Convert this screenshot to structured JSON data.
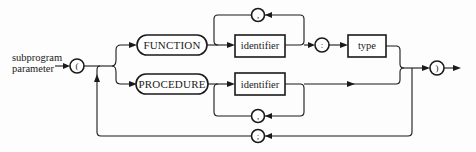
{
  "diagram": {
    "type": "syntax-diagram",
    "title_label": [
      "subprogram",
      "parameter"
    ],
    "nodes": {
      "open_paren": {
        "kind": "terminal-circle",
        "symbol": "("
      },
      "function_kw": {
        "kind": "keyword",
        "label": "FUNCTION"
      },
      "procedure_kw": {
        "kind": "keyword",
        "label": "PROCEDURE"
      },
      "identifier_top": {
        "kind": "nonterminal",
        "label": "identifier"
      },
      "identifier_bottom": {
        "kind": "nonterminal",
        "label": "identifier"
      },
      "comma_top": {
        "kind": "terminal-circle",
        "symbol": ","
      },
      "comma_bottom": {
        "kind": "terminal-circle",
        "symbol": ","
      },
      "colon": {
        "kind": "terminal-circle",
        "symbol": ":"
      },
      "type_box": {
        "kind": "nonterminal",
        "label": "type"
      },
      "semicolon_loop": {
        "kind": "terminal-circle",
        "symbol": ";"
      },
      "close_paren": {
        "kind": "terminal-circle",
        "symbol": ")"
      }
    },
    "edges": [
      [
        "entry",
        "open_paren"
      ],
      [
        "open_paren",
        "function_kw"
      ],
      [
        "open_paren",
        "procedure_kw"
      ],
      [
        "function_kw",
        "identifier_top"
      ],
      [
        "identifier_top",
        "comma_top"
      ],
      [
        "comma_top",
        "identifier_top"
      ],
      [
        "identifier_top",
        "colon"
      ],
      [
        "colon",
        "type_box"
      ],
      [
        "type_box",
        "close_paren"
      ],
      [
        "procedure_kw",
        "identifier_bottom"
      ],
      [
        "identifier_bottom",
        "comma_bottom"
      ],
      [
        "comma_bottom",
        "identifier_bottom"
      ],
      [
        "identifier_bottom",
        "close_paren"
      ],
      [
        "join",
        "semicolon_loop"
      ],
      [
        "semicolon_loop",
        "open_paren_branch"
      ],
      [
        "close_paren",
        "exit"
      ]
    ]
  }
}
